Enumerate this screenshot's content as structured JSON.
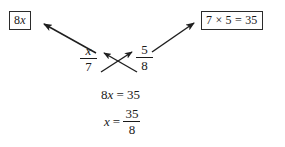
{
  "figure": {
    "background_color": "#ffffff",
    "ink_color": "#1a1a1a"
  },
  "callouts": {
    "left": {
      "text": "8x",
      "coefficient": "8",
      "variable": "x"
    },
    "right": {
      "text": "7 × 5 = 35",
      "left_factor": "7",
      "operator": "×",
      "right_factor": "5",
      "equals": "=",
      "product": "35"
    }
  },
  "proportion": {
    "left_fraction": {
      "numerator": "x",
      "denominator": "7"
    },
    "right_fraction": {
      "numerator": "5",
      "denominator": "8"
    }
  },
  "steps": {
    "step1": "8x = 35",
    "step2": {
      "lhs": "x =",
      "numerator": "35",
      "denominator": "8"
    }
  },
  "arrows": {
    "to_left_callout": {
      "label": "arrow-to-8x-callout",
      "direction": "up-left",
      "from": [
        96,
        53
      ],
      "to": [
        41,
        22
      ]
    },
    "to_right_callout": {
      "label": "arrow-to-7x5-callout",
      "direction": "up-right",
      "from": [
        152,
        52
      ],
      "to": [
        197,
        21
      ]
    },
    "cross_denominator_to_numerator_right": {
      "label": "cross-arrow-7-to-5",
      "direction": "up-right",
      "from": [
        101,
        72
      ],
      "to": [
        134,
        51
      ]
    },
    "cross_denominator_to_numerator_left": {
      "label": "cross-arrow-8-to-x",
      "direction": "up-left",
      "from": [
        137,
        72
      ],
      "to": [
        101,
        52
      ]
    }
  }
}
